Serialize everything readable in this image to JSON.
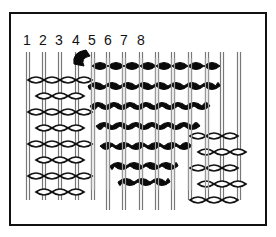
{
  "diagram": {
    "title": "",
    "warp_labels": [
      "1",
      "2",
      "3",
      "4",
      "5",
      "6",
      "7",
      "8"
    ],
    "colors": {
      "background": "#ffffff",
      "border": "#111111",
      "dark_weft": "#0a0a0a",
      "light_weft_outline": "#111111",
      "warp": "#888888"
    }
  }
}
